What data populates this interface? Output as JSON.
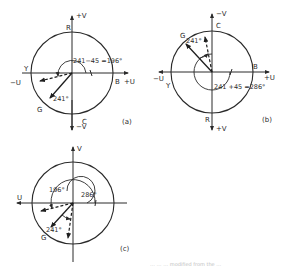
{
  "figure": {
    "panels": [
      {
        "id": "a",
        "caption": "(a)",
        "axis_labels": {
          "pos_v": "+V",
          "neg_v": "−V",
          "neg_u": "−U",
          "pos_u": "+U"
        },
        "circle_labels": {
          "top": "R",
          "bottom": "C",
          "left": "Y",
          "right": "B",
          "lower_left": "G"
        },
        "vector_label": "241°",
        "angle_label": "241−45 =196°"
      },
      {
        "id": "b",
        "caption": "(b)",
        "axis_labels": {
          "neg_v": "−V",
          "pos_v": "+V",
          "neg_u": "−U",
          "pos_u": "+U"
        },
        "circle_labels": {
          "top": "C",
          "bottom": "R",
          "left": "Y",
          "right": "B",
          "upper_left": "G"
        },
        "vector_label": "241°",
        "angle_label": "241 +45 =286°"
      },
      {
        "id": "c",
        "caption": "(c)",
        "axis_labels": {
          "v": "V",
          "u": "U"
        },
        "circle_labels": {
          "lower_left": "G"
        },
        "vector_label": "241°",
        "angle_label_1": "196°",
        "angle_label_2": "286°"
      }
    ],
    "footer_text": "… … … modified from the …"
  }
}
